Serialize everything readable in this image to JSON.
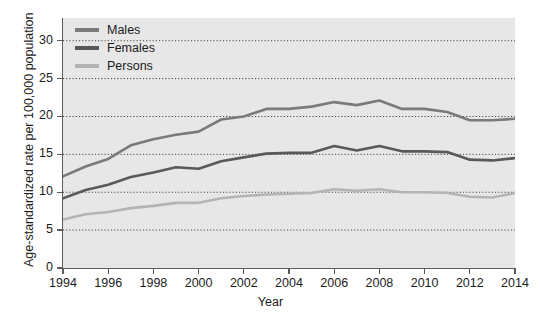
{
  "chart_data": {
    "type": "line",
    "title": "",
    "xlabel": "Year",
    "ylabel": "Age-standardized rate per 100,000 population",
    "xlim": [
      1994,
      2014
    ],
    "ylim": [
      0,
      33
    ],
    "xticks": [
      1994,
      1996,
      1998,
      2000,
      2002,
      2004,
      2006,
      2008,
      2010,
      2012,
      2014
    ],
    "xtick_labels": [
      "1994",
      "1996",
      "1998",
      "2000",
      "2002",
      "2004",
      "2006",
      "2008",
      "2010",
      "2012",
      "2014"
    ],
    "yticks": [
      0,
      5,
      10,
      15,
      20,
      25,
      30
    ],
    "ytick_labels": [
      "0",
      "5",
      "10",
      "15",
      "20",
      "25",
      "30"
    ],
    "grid": "horizontal-dotted",
    "legend_position": "top-left",
    "plot_background": "#e7e7e7",
    "x": [
      1994,
      1995,
      1996,
      1997,
      1998,
      1999,
      2000,
      2001,
      2002,
      2003,
      2004,
      2005,
      2006,
      2007,
      2008,
      2009,
      2010,
      2011,
      2012,
      2013,
      2014
    ],
    "series": [
      {
        "name": "Males",
        "color": "#7a7a7a",
        "values": [
          12.1,
          13.4,
          14.4,
          16.2,
          17.0,
          17.6,
          18.0,
          19.6,
          20.0,
          21.0,
          21.0,
          21.3,
          21.9,
          21.5,
          22.1,
          21.0,
          21.0,
          20.6,
          19.5,
          19.5,
          19.7
        ]
      },
      {
        "name": "Females",
        "color": "#595959",
        "values": [
          9.2,
          10.3,
          11.0,
          12.0,
          12.6,
          13.3,
          13.1,
          14.1,
          14.6,
          15.1,
          15.2,
          15.2,
          16.1,
          15.5,
          16.1,
          15.4,
          15.4,
          15.3,
          14.3,
          14.2,
          14.5
        ]
      },
      {
        "name": "Persons",
        "color": "#b4b4b4",
        "values": [
          6.4,
          7.1,
          7.4,
          7.9,
          8.2,
          8.6,
          8.6,
          9.2,
          9.5,
          9.7,
          9.8,
          9.9,
          10.4,
          10.2,
          10.4,
          10.0,
          10.0,
          9.9,
          9.4,
          9.3,
          9.9
        ]
      }
    ]
  }
}
